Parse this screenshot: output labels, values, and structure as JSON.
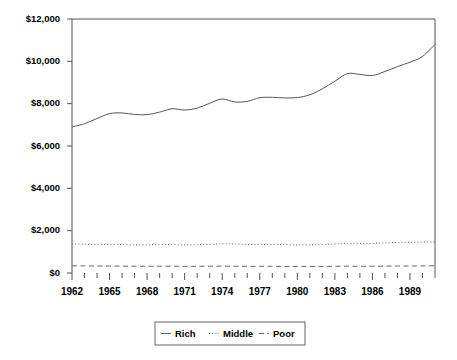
{
  "chart_data": {
    "type": "line",
    "title": "",
    "xlabel": "",
    "ylabel": "",
    "xlim": [
      1962,
      1991
    ],
    "ylim": [
      0,
      12000
    ],
    "grid": false,
    "legend_position": "bottom",
    "x": [
      1962,
      1963,
      1964,
      1965,
      1966,
      1967,
      1968,
      1969,
      1970,
      1971,
      1972,
      1973,
      1974,
      1975,
      1976,
      1977,
      1978,
      1979,
      1980,
      1981,
      1982,
      1983,
      1984,
      1985,
      1986,
      1987,
      1988,
      1989,
      1990,
      1991
    ],
    "xticks": [
      1962,
      1965,
      1968,
      1971,
      1974,
      1977,
      1980,
      1983,
      1986,
      1989
    ],
    "xtick_labels": [
      "1962",
      "1965",
      "1968",
      "1971",
      "1974",
      "1977",
      "1980",
      "1983",
      "1986",
      "1989"
    ],
    "yticks": [
      0,
      2000,
      4000,
      6000,
      8000,
      10000,
      12000
    ],
    "ytick_labels": [
      "$0",
      "$2,000",
      "$4,000",
      "$6,000",
      "$8,000",
      "$10,000",
      "$12,000"
    ],
    "series": [
      {
        "name": "Rich",
        "style": "solid",
        "color": "#555555",
        "values": [
          6900,
          7050,
          7300,
          7530,
          7560,
          7490,
          7480,
          7600,
          7760,
          7700,
          7790,
          8020,
          8220,
          8080,
          8110,
          8280,
          8300,
          8270,
          8290,
          8420,
          8700,
          9060,
          9420,
          9380,
          9330,
          9520,
          9750,
          9960,
          10230,
          10800
        ]
      },
      {
        "name": "Middle",
        "style": "dotted",
        "color": "#666666",
        "values": [
          1380,
          1360,
          1350,
          1350,
          1340,
          1330,
          1330,
          1340,
          1340,
          1330,
          1340,
          1350,
          1380,
          1370,
          1350,
          1350,
          1340,
          1340,
          1330,
          1330,
          1340,
          1370,
          1400,
          1400,
          1400,
          1420,
          1440,
          1450,
          1460,
          1470
        ]
      },
      {
        "name": "Poor",
        "style": "dashed",
        "color": "#666666",
        "values": [
          340,
          335,
          330,
          330,
          325,
          320,
          320,
          320,
          320,
          315,
          315,
          320,
          325,
          320,
          315,
          315,
          315,
          310,
          310,
          310,
          310,
          315,
          320,
          320,
          320,
          325,
          330,
          330,
          335,
          340
        ]
      }
    ]
  },
  "legend": {
    "items": [
      {
        "label": "Rich",
        "style": "solid"
      },
      {
        "label": "Middle",
        "style": "dotted"
      },
      {
        "label": "Poor",
        "style": "dashed"
      }
    ]
  }
}
